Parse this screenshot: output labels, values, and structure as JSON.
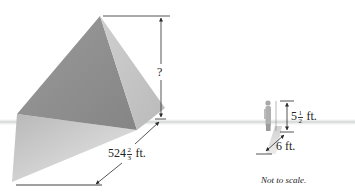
{
  "figure": {
    "type": "geometry-diagram",
    "pyramid": {
      "height_label": "?",
      "shadow_label_whole": "524",
      "shadow_label_num": "2",
      "shadow_label_den": "3",
      "shadow_label_unit": "ft."
    },
    "person": {
      "height_label_whole": "5",
      "height_label_num": "1",
      "height_label_den": "2",
      "height_label_unit": "ft.",
      "shadow_label": "6 ft."
    },
    "note": "Not to scale.",
    "colors": {
      "background": "#ffffff",
      "horizon": "#d9dcdc",
      "pyramid_left_face": "#8e8e8e",
      "pyramid_right_face": "#c4c4c4",
      "shadow": "#bdbdbd",
      "lines": "#2a2a2a"
    }
  }
}
